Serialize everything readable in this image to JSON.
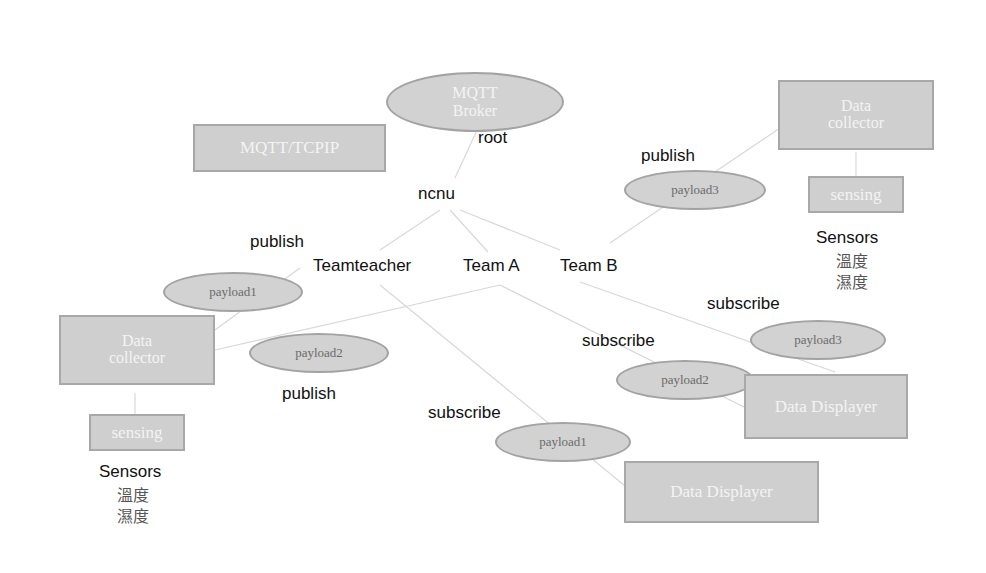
{
  "broker": {
    "line1": "MQTT",
    "line2": "Broker"
  },
  "protocol_box": "MQTT/TCPIP",
  "topics": {
    "root": "root",
    "ncnu": "ncnu",
    "teamteacher": "Teamteacher",
    "team_a": "Team A",
    "team_b": "Team B"
  },
  "left_publisher": {
    "collector_line1": "Data",
    "collector_line2": "collector",
    "sensing": "sensing",
    "sensors": "Sensors",
    "temp": "溫度",
    "humidity": "濕度",
    "publish1": "publish",
    "payload1": "payload1",
    "publish2": "publish",
    "payload2": "payload2"
  },
  "right_publisher": {
    "collector_line1": "Data",
    "collector_line2": "collector",
    "sensing": "sensing",
    "sensors": "Sensors",
    "temp": "溫度",
    "humidity": "濕度",
    "publish": "publish",
    "payload3": "payload3"
  },
  "subscribers": {
    "sub1_label": "subscribe",
    "sub1_payload": "payload1",
    "sub1_display": "Data Displayer",
    "sub2_label": "subscribe",
    "sub2_payload": "payload2",
    "sub2_display": "Data Displayer",
    "sub3_label": "subscribe",
    "sub3_payload": "payload3"
  },
  "colors": {
    "node_fill": "#cfcfcf",
    "node_border": "#a8a8a8",
    "line": "#d6d6d6"
  }
}
